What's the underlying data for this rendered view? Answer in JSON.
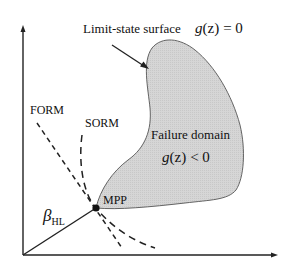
{
  "diagram": {
    "limit_state": {
      "label": "Limit-state surface",
      "equation_fn": "g",
      "equation_arg": "(z)",
      "equation_rel": "= 0"
    },
    "failure_domain": {
      "label": "Failure domain",
      "equation_fn": "g",
      "equation_arg": "(z)",
      "equation_rel": "< 0",
      "fill_color": "#d4d4d4"
    },
    "approximations": {
      "form": "FORM",
      "sorm": "SORM"
    },
    "point": {
      "label": "MPP"
    },
    "distance": {
      "symbol": "β",
      "subscript": "HL"
    }
  }
}
